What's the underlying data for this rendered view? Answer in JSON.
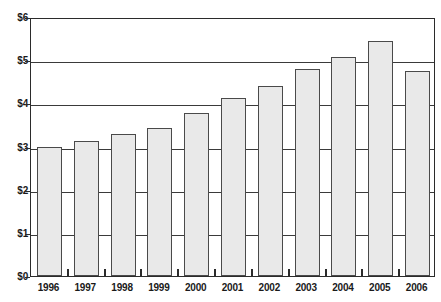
{
  "chart_data": {
    "type": "bar",
    "title": "",
    "subtitle": "",
    "xlabel": "",
    "ylabel": "",
    "categories": [
      "1996",
      "1997",
      "1998",
      "1999",
      "2000",
      "2001",
      "2002",
      "2003",
      "2004",
      "2005",
      "2006"
    ],
    "values": [
      3.0,
      3.13,
      3.28,
      3.43,
      3.77,
      4.13,
      4.41,
      4.79,
      5.08,
      5.45,
      4.75
    ],
    "ylim": [
      0,
      6
    ],
    "ytick_values": [
      0,
      1,
      2,
      3,
      4,
      5,
      6
    ],
    "ytick_labels": [
      "$0",
      "$1",
      "$2",
      "$3",
      "$4",
      "$5",
      "$6"
    ],
    "grid": "horizontal",
    "legend": "none",
    "series": [
      {
        "name": "value",
        "values": [
          3.0,
          3.13,
          3.28,
          3.43,
          3.77,
          4.13,
          4.41,
          4.79,
          5.08,
          5.45,
          4.75
        ]
      }
    ],
    "colors": {
      "bar_fill": "#e9e9e9",
      "bar_border": "#4a4a4a",
      "axis": "#2b2b2b",
      "gridline": "#3a3a3a",
      "text": "#1a1a1a",
      "background": "#ffffff"
    }
  }
}
